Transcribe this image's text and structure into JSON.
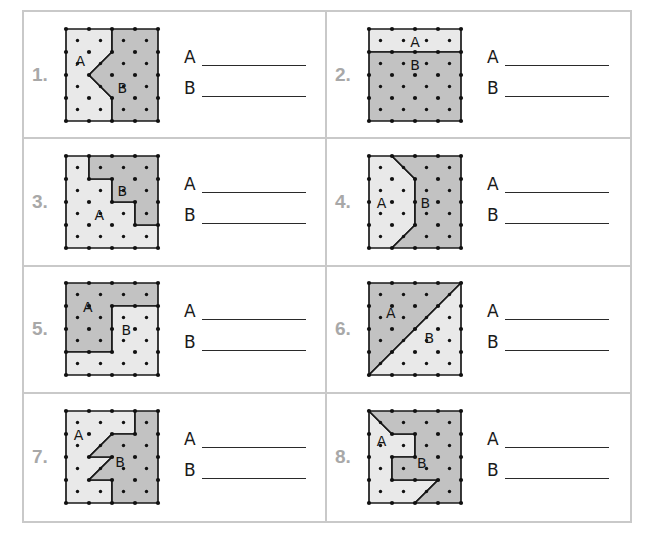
{
  "worksheet": {
    "answer_label_a": "A",
    "answer_label_b": "B",
    "region_label_a": "A",
    "region_label_b": "B",
    "colors": {
      "light_region": "#e9e9e9",
      "dark_region": "#c2c2c2",
      "outline": "#1a1a1a",
      "dot": "#111111",
      "panel_border": "#c9c9c9",
      "number_text": "#a8a8a8"
    },
    "grid": {
      "cells_across": 4,
      "cells_down": 4
    },
    "problems": [
      {
        "number": "1.",
        "label_a_pos": [
          0.62,
          1.45
        ],
        "label_b_pos": [
          2.45,
          2.62
        ],
        "shapes": [
          {
            "region": "A",
            "fill": "light",
            "points": "0,0 2,0 2,1 1,2 2,3 2,4 0,4"
          },
          {
            "region": "B",
            "fill": "dark",
            "points": "2,0 4,0 4,4 2,4 2,3 1,2 2,1"
          }
        ]
      },
      {
        "number": "2.",
        "label_a_pos": [
          2.0,
          0.62
        ],
        "label_b_pos": [
          2.0,
          1.62
        ],
        "shapes": [
          {
            "region": "A",
            "fill": "light",
            "points": "0,0 4,0 4,1 0,1"
          },
          {
            "region": "B",
            "fill": "dark",
            "points": "0,1 4,1 4,4 0,4"
          }
        ]
      },
      {
        "number": "3.",
        "label_a_pos": [
          1.45,
          2.62
        ],
        "label_b_pos": [
          2.45,
          1.55
        ],
        "shapes": [
          {
            "region": "A",
            "fill": "light",
            "points": "0,0 1,0 1,1 2,1 2,2 3,2 3,3 4,3 4,4 0,4"
          },
          {
            "region": "B",
            "fill": "dark",
            "points": "1,0 4,0 4,3 3,3 3,2 2,2 2,1 1,1"
          }
        ]
      },
      {
        "number": "4.",
        "label_a_pos": [
          0.55,
          2.08
        ],
        "label_b_pos": [
          2.45,
          2.08
        ],
        "shapes": [
          {
            "region": "A",
            "fill": "light",
            "points": "0,0 1,0 2,1 2,3 1,4 0,4"
          },
          {
            "region": "B",
            "fill": "dark",
            "points": "1,0 4,0 4,4 1,4 2,3 2,1"
          }
        ]
      },
      {
        "number": "5.",
        "label_a_pos": [
          0.95,
          1.1
        ],
        "label_b_pos": [
          2.62,
          2.1
        ],
        "shapes": [
          {
            "region": "A",
            "fill": "dark",
            "points": "0,0 4,0 4,1 2,1 2,3 0,3"
          },
          {
            "region": "B",
            "fill": "light",
            "points": "2,1 4,1 4,4 0,4 0,3 2,3"
          }
        ]
      },
      {
        "number": "6.",
        "label_a_pos": [
          0.95,
          1.35
        ],
        "label_b_pos": [
          2.62,
          2.45
        ],
        "shapes": [
          {
            "region": "A",
            "fill": "dark",
            "points": "0,0 4,0 0,4"
          },
          {
            "region": "B",
            "fill": "light",
            "points": "4,0 4,4 0,4"
          }
        ]
      },
      {
        "number": "7.",
        "label_a_pos": [
          0.55,
          1.1
        ],
        "label_b_pos": [
          2.35,
          2.25
        ],
        "shapes": [
          {
            "region": "A",
            "fill": "light",
            "points": "0,0 3,0 3,1 2,1 1,2 2,2 1,3 2,3 2,4 0,4"
          },
          {
            "region": "B",
            "fill": "dark",
            "points": "3,0 4,0 4,4 2,4 2,3 1,3 2,2 1,2 2,1 3,1"
          }
        ]
      },
      {
        "number": "8.",
        "label_a_pos": [
          0.55,
          1.35
        ],
        "label_b_pos": [
          2.3,
          2.3
        ],
        "shapes": [
          {
            "region": "A",
            "fill": "light",
            "points": "0,0 1,1 2,1 2,2 1,2 1,3 3,3 2,4 0,4"
          },
          {
            "region": "B",
            "fill": "dark",
            "points": "0,0 4,0 4,4 2,4 3,3 1,3 1,2 2,2 2,1 1,1"
          }
        ]
      }
    ]
  }
}
